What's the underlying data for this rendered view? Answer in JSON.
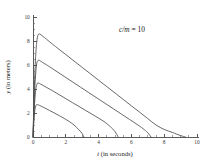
{
  "chart_data": {
    "type": "line",
    "title": "",
    "annotation": "c/m = 10",
    "annotation_parts": {
      "italic": "c/m",
      "rest": " = 10"
    },
    "xlabel": "t (in seconds)",
    "xlabel_parts": {
      "italic": "t",
      "rest": " (in seconds)"
    },
    "ylabel": "y (in meters)",
    "ylabel_parts": {
      "italic": "y",
      "rest": " (in meters)"
    },
    "xlim": [
      0,
      10
    ],
    "ylim": [
      0,
      10
    ],
    "xticks": [
      0,
      2,
      4,
      6,
      8,
      10
    ],
    "xtick_labels": [
      "0",
      "2",
      "4",
      "6",
      "8",
      "10"
    ],
    "yticks": [
      0,
      2,
      4,
      6,
      8,
      10
    ],
    "ytick_labels": [
      "0",
      "2",
      "4",
      "6",
      "8",
      "10"
    ],
    "x_minor_tick_step": 0.5,
    "y_minor_tick_step": 0.5,
    "grid": false,
    "legend": false,
    "legend_position": "none",
    "axis_color": "#5a5a5a",
    "curve_color": "#4d4d4d",
    "background_color": "#ffffff",
    "series": [
      {
        "name": "trajectory-1",
        "peak_t": 0.38,
        "peak_y": 8.6,
        "landing_t": 9.3,
        "x": [
          0,
          0.05,
          0.1,
          0.15,
          0.2,
          0.25,
          0.3,
          0.38,
          0.5,
          0.7,
          1.0,
          1.5,
          2.0,
          2.5,
          3.0,
          3.5,
          4.0,
          4.5,
          5.0,
          5.5,
          6.0,
          6.5,
          7.0,
          7.5,
          8.0,
          8.5,
          9.0,
          9.3
        ],
        "y": [
          0,
          2.6,
          4.8,
          6.4,
          7.5,
          8.15,
          8.48,
          8.6,
          8.5,
          8.28,
          7.95,
          7.4,
          6.87,
          6.33,
          5.8,
          5.27,
          4.73,
          4.2,
          3.67,
          3.13,
          2.6,
          2.07,
          1.53,
          1.0,
          0.63,
          0.38,
          0.12,
          0
        ]
      },
      {
        "name": "trajectory-2",
        "peak_t": 0.33,
        "peak_y": 6.4,
        "landing_t": 7.2,
        "x": [
          0,
          0.05,
          0.1,
          0.15,
          0.2,
          0.25,
          0.33,
          0.45,
          0.6,
          0.9,
          1.4,
          1.9,
          2.4,
          2.9,
          3.4,
          3.9,
          4.4,
          4.9,
          5.4,
          5.9,
          6.4,
          6.8,
          7.0,
          7.2
        ],
        "y": [
          0,
          2.1,
          3.8,
          5.0,
          5.85,
          6.25,
          6.4,
          6.33,
          6.2,
          5.95,
          5.5,
          5.05,
          4.6,
          4.15,
          3.7,
          3.25,
          2.8,
          2.35,
          1.9,
          1.45,
          1.0,
          0.6,
          0.35,
          0
        ]
      },
      {
        "name": "trajectory-3",
        "peak_t": 0.28,
        "peak_y": 4.5,
        "landing_t": 5.2,
        "x": [
          0,
          0.05,
          0.1,
          0.15,
          0.2,
          0.28,
          0.4,
          0.55,
          0.8,
          1.2,
          1.6,
          2.0,
          2.4,
          2.8,
          3.2,
          3.6,
          4.0,
          4.4,
          4.8,
          5.0,
          5.2
        ],
        "y": [
          0,
          1.6,
          2.85,
          3.7,
          4.2,
          4.5,
          4.45,
          4.35,
          4.15,
          3.85,
          3.52,
          3.2,
          2.87,
          2.55,
          2.22,
          1.9,
          1.57,
          1.22,
          0.75,
          0.45,
          0
        ]
      },
      {
        "name": "trajectory-4",
        "peak_t": 0.23,
        "peak_y": 2.7,
        "landing_t": 3.1,
        "x": [
          0,
          0.04,
          0.08,
          0.12,
          0.17,
          0.23,
          0.33,
          0.48,
          0.7,
          1.0,
          1.3,
          1.6,
          1.9,
          2.2,
          2.5,
          2.8,
          3.0,
          3.1
        ],
        "y": [
          0,
          1.05,
          1.82,
          2.3,
          2.6,
          2.7,
          2.67,
          2.58,
          2.43,
          2.22,
          2.0,
          1.78,
          1.55,
          1.3,
          1.0,
          0.6,
          0.28,
          0
        ]
      }
    ]
  }
}
